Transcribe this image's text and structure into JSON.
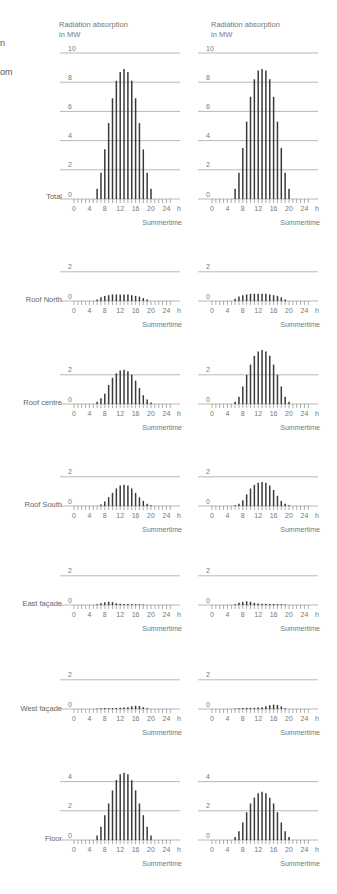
{
  "header": {
    "left_cut_lines": [
      "n",
      "om"
    ],
    "columns": [
      {
        "title_line1": "Radiation absorption",
        "title_line2": "in MW"
      },
      {
        "title_line1": "Radiation absorption",
        "title_line2": "in MW"
      }
    ]
  },
  "axis": {
    "x_ticks": [
      "0",
      "4",
      "8",
      "12",
      "16",
      "20",
      "24"
    ],
    "x_unit": "h",
    "x_caption": "Summertime"
  },
  "rows": [
    {
      "label": "Total",
      "ymax": 10,
      "yticks": [
        0,
        2,
        4,
        6,
        8,
        10
      ]
    },
    {
      "label": "Roof North",
      "ymax": 2,
      "yticks": [
        0,
        2
      ]
    },
    {
      "label": "Roof centre",
      "ymax": 2,
      "yticks": [
        0,
        2
      ]
    },
    {
      "label": "Roof South",
      "ymax": 2,
      "yticks": [
        0,
        2
      ]
    },
    {
      "label": "East façade",
      "ymax": 2,
      "yticks": [
        0,
        2
      ]
    },
    {
      "label": "West façade",
      "ymax": 2,
      "yticks": [
        0,
        2
      ]
    },
    {
      "label": "Floor",
      "ymax": 4,
      "yticks": [
        0,
        2,
        4
      ]
    }
  ],
  "chart_data": [
    {
      "type": "bar",
      "title": "Total (left)",
      "ylabel": "Radiation absorption in MW",
      "xlabel": "Summertime (h)",
      "x": [
        6,
        7,
        8,
        9,
        10,
        11,
        12,
        13,
        14,
        15,
        16,
        17,
        18,
        19,
        20
      ],
      "values": [
        0.7,
        1.8,
        3.4,
        5.2,
        6.9,
        8.1,
        8.7,
        8.9,
        8.7,
        8.1,
        6.9,
        5.2,
        3.4,
        1.8,
        0.7
      ],
      "ylim": [
        0,
        10
      ]
    },
    {
      "type": "bar",
      "title": "Total (right)",
      "ylabel": "Radiation absorption in MW",
      "xlabel": "Summertime (h)",
      "x": [
        6,
        7,
        8,
        9,
        10,
        11,
        12,
        13,
        14,
        15,
        16,
        17,
        18,
        19,
        20
      ],
      "values": [
        0.7,
        1.8,
        3.5,
        5.3,
        7.0,
        8.2,
        8.8,
        8.9,
        8.8,
        8.2,
        7.0,
        5.3,
        3.5,
        1.8,
        0.7
      ],
      "ylim": [
        0,
        10
      ]
    },
    {
      "type": "bar",
      "title": "Roof North (left)",
      "x": [
        6,
        7,
        8,
        9,
        10,
        11,
        12,
        13,
        14,
        15,
        16,
        17,
        18,
        19
      ],
      "values": [
        0.1,
        0.25,
        0.35,
        0.4,
        0.45,
        0.45,
        0.45,
        0.45,
        0.45,
        0.4,
        0.35,
        0.3,
        0.2,
        0.1
      ],
      "ylim": [
        0,
        2
      ]
    },
    {
      "type": "bar",
      "title": "Roof North (right)",
      "x": [
        6,
        7,
        8,
        9,
        10,
        11,
        12,
        13,
        14,
        15,
        16,
        17,
        18,
        19
      ],
      "values": [
        0.15,
        0.3,
        0.4,
        0.45,
        0.5,
        0.5,
        0.5,
        0.5,
        0.5,
        0.45,
        0.4,
        0.35,
        0.25,
        0.1
      ],
      "ylim": [
        0,
        2
      ]
    },
    {
      "type": "bar",
      "title": "Roof centre (left)",
      "x": [
        6,
        7,
        8,
        9,
        10,
        11,
        12,
        13,
        14,
        15,
        16,
        17,
        18,
        19,
        20
      ],
      "values": [
        0.15,
        0.4,
        0.7,
        1.3,
        1.8,
        2.1,
        2.3,
        2.35,
        2.25,
        2.0,
        1.6,
        1.1,
        0.6,
        0.3,
        0.1
      ],
      "ylim": [
        0,
        2
      ]
    },
    {
      "type": "bar",
      "title": "Roof centre (right)",
      "x": [
        6,
        7,
        8,
        9,
        10,
        11,
        12,
        13,
        14,
        15,
        16,
        17,
        18,
        19,
        20
      ],
      "values": [
        0.15,
        0.5,
        1.2,
        2.0,
        2.7,
        3.3,
        3.6,
        3.7,
        3.6,
        3.3,
        2.7,
        2.0,
        1.2,
        0.5,
        0.15
      ],
      "ylim": [
        0,
        2
      ]
    },
    {
      "type": "bar",
      "title": "Roof South (left)",
      "x": [
        7,
        8,
        9,
        10,
        11,
        12,
        13,
        14,
        15,
        16,
        17,
        18,
        19,
        20
      ],
      "values": [
        0.1,
        0.3,
        0.6,
        0.9,
        1.2,
        1.4,
        1.45,
        1.4,
        1.2,
        0.9,
        0.6,
        0.35,
        0.15,
        0.05
      ],
      "ylim": [
        0,
        2
      ]
    },
    {
      "type": "bar",
      "title": "Roof South (right)",
      "x": [
        6,
        7,
        8,
        9,
        10,
        11,
        12,
        13,
        14,
        15,
        16,
        17,
        18,
        19,
        20
      ],
      "values": [
        0.05,
        0.15,
        0.4,
        0.8,
        1.2,
        1.45,
        1.6,
        1.65,
        1.6,
        1.4,
        1.1,
        0.7,
        0.35,
        0.15,
        0.05
      ],
      "ylim": [
        0,
        2
      ]
    },
    {
      "type": "bar",
      "title": "East façade (left)",
      "x": [
        6,
        7,
        8,
        9,
        10,
        11,
        12,
        13,
        14,
        15,
        16,
        17,
        18
      ],
      "values": [
        0.05,
        0.12,
        0.18,
        0.22,
        0.2,
        0.12,
        0.08,
        0.06,
        0.06,
        0.05,
        0.05,
        0.04,
        0.03
      ],
      "ylim": [
        0,
        2
      ]
    },
    {
      "type": "bar",
      "title": "East façade (right)",
      "x": [
        6,
        7,
        8,
        9,
        10,
        11,
        12,
        13,
        14,
        15,
        16,
        17,
        18,
        19
      ],
      "values": [
        0.05,
        0.15,
        0.2,
        0.25,
        0.22,
        0.15,
        0.1,
        0.08,
        0.08,
        0.07,
        0.07,
        0.06,
        0.05,
        0.03
      ],
      "ylim": [
        0,
        2
      ]
    },
    {
      "type": "bar",
      "title": "West façade (left)",
      "x": [
        6,
        7,
        8,
        9,
        10,
        11,
        12,
        13,
        14,
        15,
        16,
        17,
        18,
        19
      ],
      "values": [
        0.03,
        0.05,
        0.06,
        0.06,
        0.07,
        0.07,
        0.08,
        0.1,
        0.12,
        0.18,
        0.22,
        0.2,
        0.12,
        0.05
      ],
      "ylim": [
        0,
        2
      ]
    },
    {
      "type": "bar",
      "title": "West façade (right)",
      "x": [
        6,
        7,
        8,
        9,
        10,
        11,
        12,
        13,
        14,
        15,
        16,
        17,
        18,
        19
      ],
      "values": [
        0.03,
        0.05,
        0.07,
        0.08,
        0.08,
        0.08,
        0.1,
        0.12,
        0.18,
        0.25,
        0.3,
        0.28,
        0.18,
        0.05
      ],
      "ylim": [
        0,
        2
      ]
    },
    {
      "type": "bar",
      "title": "Floor (left)",
      "x": [
        6,
        7,
        8,
        9,
        10,
        11,
        12,
        13,
        14,
        15,
        16,
        17,
        18,
        19,
        20
      ],
      "values": [
        0.3,
        0.9,
        1.7,
        2.5,
        3.4,
        4.1,
        4.5,
        4.6,
        4.5,
        4.1,
        3.4,
        2.5,
        1.7,
        0.9,
        0.3
      ],
      "ylim": [
        0,
        4
      ]
    },
    {
      "type": "bar",
      "title": "Floor (right)",
      "x": [
        6,
        7,
        8,
        9,
        10,
        11,
        12,
        13,
        14,
        15,
        16,
        17,
        18,
        19,
        20
      ],
      "values": [
        0.2,
        0.6,
        1.2,
        1.9,
        2.5,
        2.9,
        3.2,
        3.3,
        3.2,
        2.9,
        2.5,
        1.9,
        1.2,
        0.6,
        0.2
      ],
      "ylim": [
        0,
        4
      ]
    }
  ]
}
